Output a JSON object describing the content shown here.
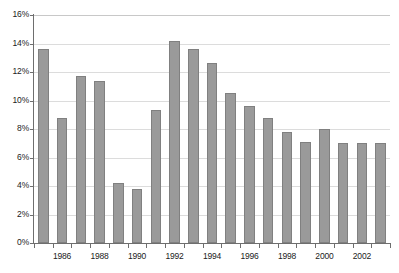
{
  "chart_data": {
    "type": "bar",
    "title": "",
    "subtitle": "",
    "xlabel": "",
    "ylabel": "",
    "ylim": [
      0,
      16
    ],
    "ytick_labels": [
      "0%",
      "2%",
      "4%",
      "6%",
      "8%",
      "10%",
      "12%",
      "14%",
      "16%"
    ],
    "ytick_values": [
      0,
      2,
      4,
      6,
      8,
      10,
      12,
      14,
      16
    ],
    "grid": true,
    "legend": false,
    "legend_position": "none",
    "value_suffix": "%",
    "categories": [
      "1985",
      "1986",
      "1987",
      "1988",
      "1989",
      "1990",
      "1991",
      "1992",
      "1993",
      "1994",
      "1995",
      "1996",
      "1997",
      "1998",
      "1999",
      "2000",
      "2001",
      "2002",
      "2003"
    ],
    "xtick_labels": [
      "1986",
      "1988",
      "1990",
      "1992",
      "1994",
      "1996",
      "1998",
      "2000",
      "2002"
    ],
    "values": [
      13.6,
      8.8,
      11.7,
      11.4,
      4.2,
      3.8,
      9.3,
      14.2,
      13.6,
      12.6,
      10.5,
      9.6,
      8.8,
      7.8,
      7.1,
      8.0,
      7.0,
      7.0,
      7.0
    ],
    "bar_color": "#9a9a9a",
    "bar_border_color": "#808080",
    "gridline_color": "#dcdcdc",
    "axis_color": "#6e6e6e"
  }
}
